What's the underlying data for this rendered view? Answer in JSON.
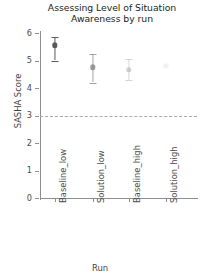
{
  "chart_data": {
    "type": "scatter",
    "title": "Assessing Level of Situation Awareness by run",
    "title_line1": "Assessing Level of Situation",
    "title_line2": "Awareness by run",
    "xlabel": "Run",
    "ylabel": "SASHA Score",
    "categories": [
      "Baseline_low",
      "Solution_low",
      "Baseline_high",
      "Solution_high"
    ],
    "values": [
      5.55,
      4.75,
      4.65,
      4.8
    ],
    "error_low": [
      5.0,
      4.2,
      4.3,
      4.75
    ],
    "error_high": [
      5.85,
      5.25,
      5.05,
      4.85
    ],
    "ylim": [
      0,
      6
    ],
    "yticks": [
      0,
      1,
      2,
      3,
      4,
      5,
      6
    ],
    "ytick_labels": [
      "0",
      "1",
      "2",
      "3",
      "4",
      "5",
      "6"
    ],
    "reference_line": 3,
    "reference_line_style": "dashed",
    "grid": false,
    "legend": "none",
    "series": [
      {
        "name": "Baseline_low",
        "value": 5.55,
        "err_low": 5.0,
        "err_high": 5.85,
        "color": "#595959",
        "opacity": 1.0
      },
      {
        "name": "Solution_low",
        "value": 4.75,
        "err_low": 4.2,
        "err_high": 5.25,
        "color": "#8a8a8a",
        "opacity": 0.78
      },
      {
        "name": "Baseline_high",
        "value": 4.65,
        "err_low": 4.3,
        "err_high": 5.05,
        "color": "#b5b5b5",
        "opacity": 0.55
      },
      {
        "name": "Solution_high",
        "value": 4.8,
        "err_low": 4.75,
        "err_high": 4.85,
        "color": "#e2e2e2",
        "opacity": 0.3
      }
    ]
  },
  "colors": {
    "axis": "#8e8e8e",
    "text": "#3f3f3f",
    "title": "#231f20",
    "reference": "#a9a9a9",
    "background": "#ffffff"
  }
}
